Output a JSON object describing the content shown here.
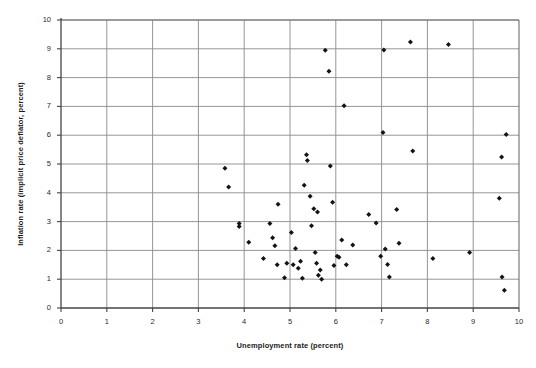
{
  "chart_data": {
    "type": "scatter",
    "title": "",
    "xlabel": "Unemployment rate (percent)",
    "ylabel": "Inflation rate (implicit price deflator, percent)",
    "xlim": [
      0,
      10
    ],
    "ylim": [
      0,
      10
    ],
    "xticks": [
      "0",
      "1",
      "2",
      "3",
      "4",
      "5",
      "6",
      "7",
      "8",
      "9",
      "10"
    ],
    "yticks": [
      "0",
      "1",
      "2",
      "3",
      "4",
      "5",
      "6",
      "7",
      "8",
      "9",
      "10"
    ],
    "grid": true,
    "legend": null,
    "marker": "diamond",
    "marker_color": "#141414",
    "grid_color": "#8a8a8a",
    "axis_color": "#444444",
    "background": "#ffffff",
    "points": [
      [
        3.58,
        4.85
      ],
      [
        3.66,
        4.2
      ],
      [
        3.89,
        2.93
      ],
      [
        3.89,
        2.83
      ],
      [
        4.1,
        2.28
      ],
      [
        4.42,
        1.72
      ],
      [
        4.56,
        2.93
      ],
      [
        4.62,
        2.44
      ],
      [
        4.67,
        2.16
      ],
      [
        4.72,
        1.5
      ],
      [
        4.74,
        3.6
      ],
      [
        4.88,
        1.05
      ],
      [
        4.93,
        1.55
      ],
      [
        5.03,
        2.62
      ],
      [
        5.07,
        1.5
      ],
      [
        5.12,
        2.07
      ],
      [
        5.18,
        1.38
      ],
      [
        5.23,
        1.62
      ],
      [
        5.27,
        1.03
      ],
      [
        5.31,
        4.26
      ],
      [
        5.36,
        5.32
      ],
      [
        5.38,
        5.12
      ],
      [
        5.44,
        3.88
      ],
      [
        5.47,
        2.86
      ],
      [
        5.52,
        3.45
      ],
      [
        5.55,
        1.93
      ],
      [
        5.58,
        1.55
      ],
      [
        5.6,
        3.33
      ],
      [
        5.62,
        1.14
      ],
      [
        5.66,
        1.32
      ],
      [
        5.69,
        1.0
      ],
      [
        5.77,
        8.95
      ],
      [
        5.85,
        8.22
      ],
      [
        5.88,
        4.93
      ],
      [
        5.93,
        3.67
      ],
      [
        5.96,
        1.48
      ],
      [
        6.03,
        1.8
      ],
      [
        6.07,
        1.76
      ],
      [
        6.13,
        2.36
      ],
      [
        6.18,
        7.02
      ],
      [
        6.23,
        1.5
      ],
      [
        6.37,
        2.19
      ],
      [
        6.72,
        3.25
      ],
      [
        6.88,
        2.95
      ],
      [
        6.98,
        1.8
      ],
      [
        7.03,
        6.09
      ],
      [
        7.05,
        8.96
      ],
      [
        7.08,
        2.05
      ],
      [
        7.13,
        1.51
      ],
      [
        7.17,
        1.08
      ],
      [
        7.33,
        3.42
      ],
      [
        7.38,
        2.25
      ],
      [
        7.63,
        9.24
      ],
      [
        7.68,
        5.45
      ],
      [
        8.12,
        1.72
      ],
      [
        8.46,
        9.15
      ],
      [
        8.92,
        1.93
      ],
      [
        9.57,
        3.81
      ],
      [
        9.62,
        5.24
      ],
      [
        9.63,
        1.08
      ],
      [
        9.72,
        6.02
      ],
      [
        9.68,
        0.62
      ]
    ]
  }
}
